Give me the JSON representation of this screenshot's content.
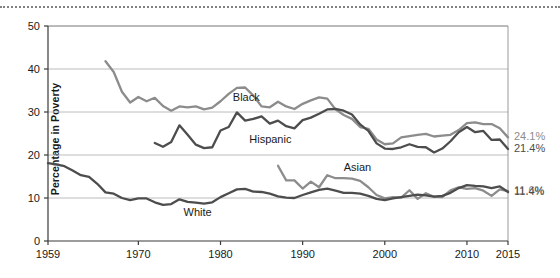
{
  "chart_data": {
    "type": "line",
    "title": "",
    "xlabel": "",
    "ylabel": "Percentage in Poverty",
    "xlim": [
      1959,
      2015
    ],
    "ylim": [
      0,
      50
    ],
    "ytick_labels": [
      "0",
      "10",
      "20",
      "30",
      "40",
      "50"
    ],
    "ytick_values": [
      0,
      10,
      20,
      30,
      40,
      50
    ],
    "xtick_labels": [
      "1959",
      "1970",
      "1980",
      "1990",
      "2000",
      "2010",
      "2015"
    ],
    "xtick_values": [
      1959,
      1970,
      1980,
      1990,
      2000,
      2010,
      2015
    ],
    "grid": "horizontal",
    "legend": "inline-labels",
    "series": [
      {
        "name": "Black",
        "color": "#8c8c8c",
        "label_x": 1981.5,
        "label_y": 33.2,
        "end_label": "24.1%",
        "x": [
          1966,
          1967,
          1968,
          1969,
          1970,
          1971,
          1972,
          1973,
          1974,
          1975,
          1976,
          1977,
          1978,
          1979,
          1980,
          1981,
          1982,
          1983,
          1984,
          1985,
          1986,
          1987,
          1988,
          1989,
          1990,
          1991,
          1992,
          1993,
          1994,
          1995,
          1996,
          1997,
          1998,
          1999,
          2000,
          2001,
          2002,
          2003,
          2004,
          2005,
          2006,
          2007,
          2008,
          2009,
          2010,
          2011,
          2012,
          2013,
          2014,
          2015
        ],
        "y": [
          41.8,
          39.3,
          34.7,
          32.2,
          33.5,
          32.5,
          33.3,
          31.4,
          30.3,
          31.3,
          31.1,
          31.3,
          30.6,
          31.0,
          32.5,
          34.2,
          35.6,
          35.7,
          33.8,
          31.3,
          31.1,
          32.4,
          31.3,
          30.7,
          31.9,
          32.7,
          33.4,
          33.1,
          30.6,
          29.3,
          28.4,
          26.5,
          26.1,
          23.6,
          22.5,
          22.7,
          24.1,
          24.4,
          24.7,
          24.9,
          24.3,
          24.5,
          24.7,
          25.8,
          27.4,
          27.6,
          27.2,
          27.2,
          26.2,
          24.1
        ]
      },
      {
        "name": "Hispanic",
        "color": "#4d4d4d",
        "label_x": 1983.5,
        "label_y": 23.4,
        "end_label": "21.4%",
        "x": [
          1972,
          1973,
          1974,
          1975,
          1976,
          1977,
          1978,
          1979,
          1980,
          1981,
          1982,
          1983,
          1984,
          1985,
          1986,
          1987,
          1988,
          1989,
          1990,
          1991,
          1992,
          1993,
          1994,
          1995,
          1996,
          1997,
          1998,
          1999,
          2000,
          2001,
          2002,
          2003,
          2004,
          2005,
          2006,
          2007,
          2008,
          2009,
          2010,
          2011,
          2012,
          2013,
          2014,
          2015
        ],
        "y": [
          22.8,
          21.9,
          23.0,
          26.9,
          24.7,
          22.4,
          21.6,
          21.8,
          25.7,
          26.5,
          29.9,
          28.0,
          28.4,
          29.0,
          27.3,
          28.0,
          26.7,
          26.2,
          28.1,
          28.7,
          29.6,
          30.6,
          30.7,
          30.3,
          29.4,
          27.1,
          25.6,
          22.7,
          21.5,
          21.4,
          21.8,
          22.5,
          21.9,
          21.8,
          20.6,
          21.5,
          23.2,
          25.3,
          26.5,
          25.3,
          25.6,
          23.5,
          23.6,
          21.4
        ]
      },
      {
        "name": "Asian",
        "color": "#8c8c8c",
        "label_x": 1995.0,
        "label_y": 17.0,
        "end_label": "11.6%",
        "x": [
          1987,
          1988,
          1989,
          1990,
          1991,
          1992,
          1993,
          1994,
          1995,
          1996,
          1997,
          1998,
          1999,
          2000,
          2001,
          2002,
          2003,
          2004,
          2005,
          2006,
          2007,
          2008,
          2009,
          2010,
          2011,
          2012,
          2013,
          2014,
          2015
        ],
        "y": [
          17.5,
          14.1,
          14.1,
          12.2,
          13.8,
          12.5,
          15.3,
          14.6,
          14.6,
          14.5,
          14.0,
          12.5,
          10.7,
          9.9,
          10.2,
          10.1,
          11.8,
          9.8,
          11.1,
          10.3,
          10.2,
          11.8,
          12.5,
          12.1,
          12.3,
          11.7,
          10.5,
          12.0,
          11.6
        ]
      },
      {
        "name": "White",
        "color": "#4d4d4d",
        "label_x": 1975.5,
        "label_y": 6.4,
        "end_label": "11.4%",
        "x": [
          1959,
          1960,
          1961,
          1962,
          1963,
          1964,
          1965,
          1966,
          1967,
          1968,
          1969,
          1970,
          1971,
          1972,
          1973,
          1974,
          1975,
          1976,
          1977,
          1978,
          1979,
          1980,
          1981,
          1982,
          1983,
          1984,
          1985,
          1986,
          1987,
          1988,
          1989,
          1990,
          1991,
          1992,
          1993,
          1994,
          1995,
          1996,
          1997,
          1998,
          1999,
          2000,
          2001,
          2002,
          2003,
          2004,
          2005,
          2006,
          2007,
          2008,
          2009,
          2010,
          2011,
          2012,
          2013,
          2014,
          2015
        ],
        "y": [
          18.1,
          17.8,
          17.4,
          16.4,
          15.3,
          14.9,
          13.3,
          11.3,
          11.0,
          10.0,
          9.5,
          9.9,
          9.9,
          9.0,
          8.4,
          8.6,
          9.7,
          9.1,
          8.9,
          8.7,
          9.0,
          10.2,
          11.1,
          12.0,
          12.1,
          11.5,
          11.4,
          11.0,
          10.4,
          10.1,
          10.0,
          10.7,
          11.3,
          11.9,
          12.2,
          11.7,
          11.2,
          11.2,
          11.0,
          10.5,
          9.8,
          9.5,
          9.9,
          10.2,
          10.5,
          10.8,
          10.6,
          10.3,
          10.5,
          11.2,
          12.3,
          13.0,
          12.8,
          12.7,
          12.3,
          12.7,
          11.4
        ]
      }
    ]
  },
  "axis": {
    "ylabel": "Percentage in Poverty"
  }
}
